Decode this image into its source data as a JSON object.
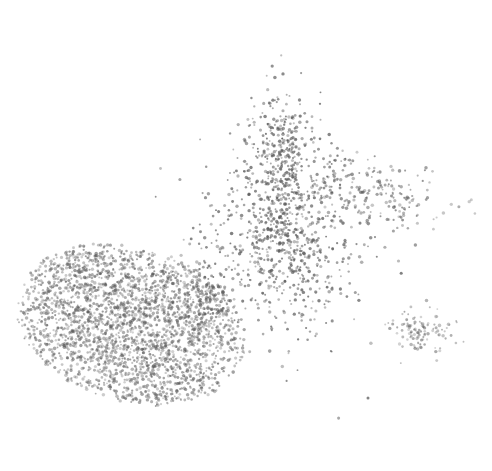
{
  "chart_data": {
    "type": "scatter",
    "title": "",
    "xlabel": "",
    "ylabel": "",
    "axes_visible": false,
    "grid": false,
    "legend": "none",
    "xlim": [
      0,
      100
    ],
    "ylim": [
      0,
      100
    ],
    "point_color": "#5a5a5a",
    "background": "#ffffff",
    "clusters": [
      {
        "name": "large-dense-cluster",
        "center": [
          24,
          30
        ],
        "spread": [
          14,
          10
        ],
        "tilt": -0.35,
        "count": 2600,
        "opacity": 0.55
      },
      {
        "name": "central-branching-cluster",
        "center": [
          57,
          50
        ],
        "spread": [
          8,
          11
        ],
        "tilt": 0.2,
        "count": 700,
        "opacity": 0.7
      },
      {
        "name": "upper-arm-cluster",
        "center": [
          57,
          70
        ],
        "spread": [
          3.5,
          8
        ],
        "tilt": 0.0,
        "count": 320,
        "opacity": 0.7
      },
      {
        "name": "right-sparse-arm",
        "center": [
          75,
          62
        ],
        "spread": [
          8,
          4
        ],
        "tilt": -0.3,
        "count": 220,
        "opacity": 0.6
      },
      {
        "name": "isolated-small-cluster",
        "center": [
          87,
          28
        ],
        "spread": [
          3.5,
          2.8
        ],
        "tilt": 0.0,
        "count": 110,
        "opacity": 0.5
      },
      {
        "name": "bridge-fragments",
        "center": [
          41,
          38
        ],
        "spread": [
          3,
          5
        ],
        "tilt": 0.0,
        "count": 80,
        "opacity": 0.7
      }
    ]
  }
}
